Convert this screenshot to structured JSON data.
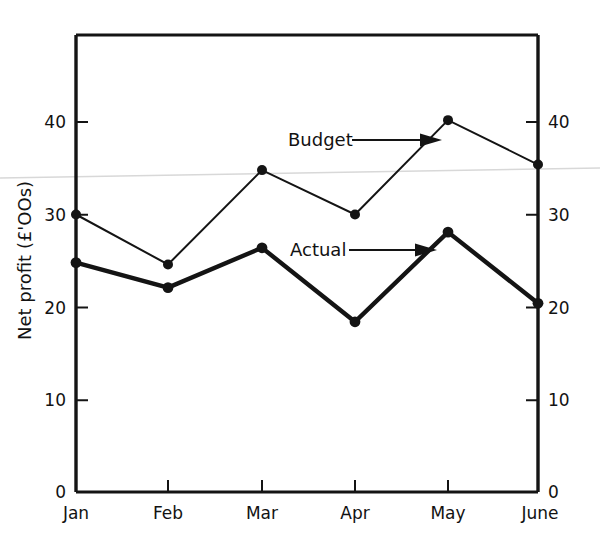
{
  "chart_data": {
    "type": "line",
    "title": "",
    "subtitle": "",
    "xlabel": "",
    "ylabel": "Net profit (£'OOs)",
    "categories": [
      "Jan",
      "Feb",
      "Mar",
      "Apr",
      "May",
      "June"
    ],
    "ylim": [
      0,
      45
    ],
    "y_ticks": [
      0,
      10,
      20,
      30,
      40
    ],
    "y_tick_labels": [
      "0",
      "10",
      "20",
      "30",
      "40"
    ],
    "right_axis_ticks": [
      0,
      10,
      20,
      30,
      40
    ],
    "right_axis_tick_labels": [
      "0",
      "10",
      "20",
      "30",
      "40"
    ],
    "grid": false,
    "legend": "annotations-with-arrows",
    "series": [
      {
        "name": "Budget",
        "values": [
          30.0,
          24.6,
          34.8,
          30.0,
          40.2,
          35.4
        ],
        "line_style": "thin",
        "color": "#141414",
        "marker": "filled-circle"
      },
      {
        "name": "Actual",
        "values": [
          24.8,
          22.1,
          26.4,
          18.4,
          28.1,
          20.4
        ],
        "line_style": "thick",
        "color": "#141414",
        "marker": "filled-circle"
      }
    ],
    "annotations": [
      {
        "text": "Budget",
        "points_to": "budget-series",
        "arrow": "right"
      },
      {
        "text": "Actual",
        "points_to": "actual-series",
        "arrow": "right"
      }
    ]
  },
  "axes": {
    "left_zero_label": "0",
    "right_zero_label": "0"
  },
  "colors": {
    "ink": "#141414",
    "background": "#ffffff",
    "artifact": "#d8d8d8"
  }
}
